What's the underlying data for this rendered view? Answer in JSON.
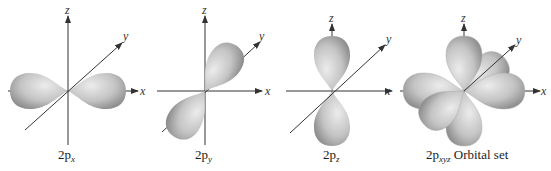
{
  "diagram": {
    "type": "orbital-shapes",
    "panels": [
      {
        "id": "px",
        "caption_main": "2p",
        "caption_sub": "x",
        "caption_suffix": "",
        "lobe_axis": "x"
      },
      {
        "id": "py",
        "caption_main": "2p",
        "caption_sub": "y",
        "caption_suffix": "",
        "lobe_axis": "y"
      },
      {
        "id": "pz",
        "caption_main": "2p",
        "caption_sub": "z",
        "caption_suffix": "",
        "lobe_axis": "z"
      },
      {
        "id": "pxyz",
        "caption_main": "2p",
        "caption_sub": "xyz",
        "caption_suffix": " Orbital set",
        "lobe_axis": "all"
      }
    ],
    "axis_labels": {
      "x": "x",
      "y": "y",
      "z": "z"
    },
    "colors": {
      "lobe_light": "#e6e6e6",
      "lobe_dark": "#9a9a9a",
      "axis": "#333333"
    }
  }
}
